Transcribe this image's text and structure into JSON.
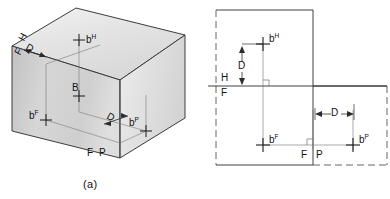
{
  "figure": {
    "captions": {
      "a": "(a)",
      "b": "(b)"
    }
  },
  "pictorial": {
    "name": "glass-box-pictorial",
    "labels": {
      "h_plane": "H",
      "f_plane_top": "F",
      "point_bh": "b",
      "point_bh_sup": "H",
      "depth_top": "D",
      "b_vertex": "B",
      "point_bf": "b",
      "point_bf_sup": "F",
      "depth_right": "D",
      "point_bp": "b",
      "point_bp_sup": "P",
      "f_plane_bottom": "F",
      "p_plane_bottom": "P"
    },
    "colors": {
      "top_face": "#e9e9e9",
      "left_face": "#d2d2d2",
      "right_face": "#e3e3e3",
      "outline": "#3c3c3c",
      "thin_line": "#6e6e6e"
    }
  },
  "orthographic": {
    "name": "unfolded-views",
    "labels": {
      "point_bh": "b",
      "point_bh_sup": "H",
      "depth_vertical": "D",
      "h_label": "H",
      "f_label_left": "F",
      "point_bf": "b",
      "point_bf_sup": "F",
      "depth_horizontal": "D",
      "f_label_bottom": "F",
      "p_label_bottom": "P",
      "point_bp": "b",
      "point_bp_sup": "P"
    },
    "colors": {
      "solid_line": "#2b2b2b",
      "dashed_line": "#555555",
      "thin_line": "#6e6e6e"
    }
  }
}
